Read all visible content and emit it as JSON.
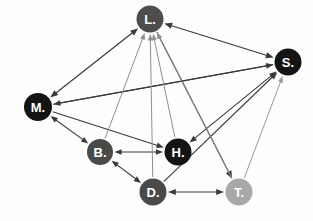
{
  "figure": {
    "type": "network-diagram",
    "background_color": "#fdfdfd",
    "width": 313,
    "height": 221
  },
  "nodes": [
    {
      "id": "L",
      "label": "L.",
      "x": 150,
      "y": 19,
      "r": 13.5,
      "color": "#4d4d4d",
      "text_color": "#ffffff",
      "font_size": 13
    },
    {
      "id": "S",
      "label": "S.",
      "x": 288,
      "y": 62,
      "r": 13.5,
      "color": "#141414",
      "text_color": "#ffffff",
      "font_size": 13
    },
    {
      "id": "M",
      "label": "M.",
      "x": 38,
      "y": 107,
      "r": 14,
      "color": "#141414",
      "text_color": "#ffffff",
      "font_size": 13
    },
    {
      "id": "B",
      "label": "B.",
      "x": 100,
      "y": 152,
      "r": 13,
      "color": "#4a4a4a",
      "text_color": "#ffffff",
      "font_size": 13
    },
    {
      "id": "H",
      "label": "H.",
      "x": 178,
      "y": 152,
      "r": 13.5,
      "color": "#141414",
      "text_color": "#ffffff",
      "font_size": 13
    },
    {
      "id": "D",
      "label": "D.",
      "x": 153,
      "y": 192,
      "r": 13.5,
      "color": "#4a4a4a",
      "text_color": "#ffffff",
      "font_size": 13
    },
    {
      "id": "T",
      "label": "T.",
      "x": 239,
      "y": 192,
      "r": 13.5,
      "color": "#a8a8a8",
      "text_color": "#ffffff",
      "font_size": 13
    }
  ],
  "edges": [
    {
      "from": "M",
      "to": "L",
      "direction": "both",
      "color": "#3a3a3a",
      "width": 1.2
    },
    {
      "from": "L",
      "to": "S",
      "direction": "both",
      "color": "#3a3a3a",
      "width": 1.2
    },
    {
      "from": "M",
      "to": "S",
      "direction": "to",
      "color": "#3a3a3a",
      "width": 1.1
    },
    {
      "from": "S",
      "to": "M",
      "direction": "to",
      "color": "#3a3a3a",
      "width": 1.1
    },
    {
      "from": "M",
      "to": "B",
      "direction": "both",
      "color": "#3a3a3a",
      "width": 1.1
    },
    {
      "from": "M",
      "to": "H",
      "direction": "to",
      "color": "#3a3a3a",
      "width": 1.1
    },
    {
      "from": "B",
      "to": "H",
      "direction": "both",
      "color": "#3a3a3a",
      "width": 1.1
    },
    {
      "from": "B",
      "to": "D",
      "direction": "both",
      "color": "#3a3a3a",
      "width": 1.1
    },
    {
      "from": "D",
      "to": "T",
      "direction": "both",
      "color": "#3a3a3a",
      "width": 1.2
    },
    {
      "from": "H",
      "to": "S",
      "direction": "both",
      "color": "#3a3a3a",
      "width": 1.1
    },
    {
      "from": "D",
      "to": "S",
      "direction": "to",
      "color": "#3a3a3a",
      "width": 1.1
    },
    {
      "from": "T",
      "to": "S",
      "direction": "to",
      "color": "#9a9a9a",
      "width": 1.0
    },
    {
      "from": "L",
      "to": "T",
      "direction": "to",
      "color": "#3a3a3a",
      "width": 1.2
    },
    {
      "from": "B",
      "to": "L",
      "direction": "to",
      "color": "#8f8f8f",
      "width": 1.0
    },
    {
      "from": "D",
      "to": "L",
      "direction": "to",
      "color": "#8f8f8f",
      "width": 1.0
    },
    {
      "from": "H",
      "to": "L",
      "direction": "to",
      "color": "#8f8f8f",
      "width": 1.0
    },
    {
      "from": "T",
      "to": "L",
      "direction": "to",
      "color": "#8f8f8f",
      "width": 1.0
    }
  ],
  "chart_data": {
    "type": "diagram",
    "title": "",
    "node_ids": [
      "L",
      "S",
      "M",
      "B",
      "H",
      "D",
      "T"
    ],
    "node_labels": [
      "L.",
      "S.",
      "M.",
      "B.",
      "H.",
      "D.",
      "T."
    ],
    "edge_count": 17,
    "legend": [],
    "annotations": []
  }
}
